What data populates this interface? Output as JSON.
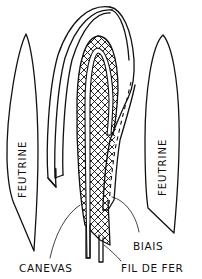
{
  "diagram": {
    "type": "technical-illustration",
    "ink_color": "#111111",
    "background_color": "#ffffff",
    "labels": {
      "felt_left": "FEUTRINE",
      "felt_right": "FEUTRINE",
      "bias": "BIAIS",
      "canvas": "CANEVAS",
      "wire": "FIL DE FER"
    },
    "parts": [
      {
        "id": "felt-left",
        "label": "FEUTRINE",
        "position": "left"
      },
      {
        "id": "felt-right",
        "label": "FEUTRINE",
        "position": "right"
      },
      {
        "id": "bias-strip",
        "label": "BIAIS",
        "position": "center loop, dashed stitch line"
      },
      {
        "id": "canvas",
        "label": "CANEVAS",
        "position": "center, cross-hatched"
      },
      {
        "id": "wire",
        "label": "FIL DE FER",
        "position": "center, two wire ends at bottom"
      }
    ]
  }
}
